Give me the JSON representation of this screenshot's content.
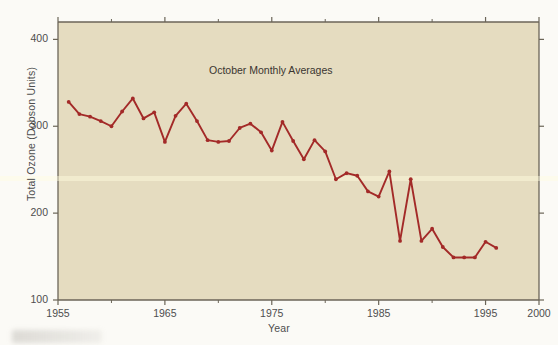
{
  "chart_data": {
    "type": "line",
    "title": "October Monthly Averages",
    "xlabel": "Year",
    "ylabel": "Total Ozone (Dobson Units)",
    "xlim": [
      1955,
      2000
    ],
    "ylim": [
      100,
      420
    ],
    "xticks": [
      1955,
      1965,
      1975,
      1985,
      1995,
      2000
    ],
    "xticklabels": [
      "1955",
      "1965",
      "1975",
      "1985",
      "1995",
      "2000"
    ],
    "yticks": [
      100,
      200,
      300,
      400
    ],
    "yticklabels": [
      "100",
      "200",
      "300",
      "400"
    ],
    "xminorticks": [
      1960,
      1970,
      1980,
      1990
    ],
    "yminorticks": [],
    "grid": false,
    "legend": null,
    "series": [
      {
        "name": "Total Ozone",
        "color": "#a32a28",
        "marker": "circle",
        "x": [
          1956,
          1957,
          1958,
          1959,
          1960,
          1961,
          1962,
          1963,
          1964,
          1965,
          1966,
          1967,
          1968,
          1969,
          1970,
          1971,
          1972,
          1973,
          1974,
          1975,
          1976,
          1977,
          1978,
          1979,
          1980,
          1981,
          1982,
          1983,
          1984,
          1985,
          1986,
          1987,
          1988,
          1989,
          1990,
          1991,
          1992,
          1993,
          1994,
          1995,
          1996
        ],
        "values": [
          328,
          314,
          311,
          306,
          300,
          317,
          332,
          309,
          316,
          282,
          312,
          326,
          306,
          284,
          282,
          283,
          298,
          303,
          293,
          272,
          305,
          283,
          262,
          284,
          271,
          239,
          246,
          243,
          225,
          219,
          248,
          168,
          239,
          168,
          182,
          161,
          149,
          149,
          149,
          167,
          160
        ]
      }
    ]
  },
  "style": {
    "plot_background": "#e5dcc0",
    "figure_background": "#fbfaf6",
    "axis_color": "#6b6558",
    "text_color": "#4e4e4e",
    "line_color": "#a32a28"
  }
}
